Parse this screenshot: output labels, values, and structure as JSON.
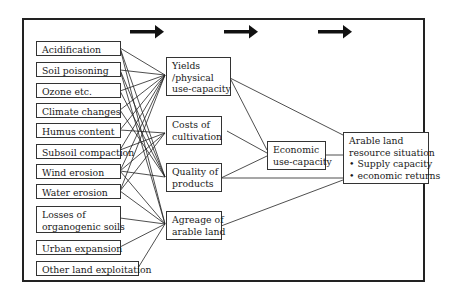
{
  "diagram": {
    "flow_arrows": [
      "arrow-1",
      "arrow-2",
      "arrow-3"
    ],
    "factors": [
      {
        "id": "acidification",
        "label": "Acidification"
      },
      {
        "id": "soil-poisoning",
        "label": "Soil poisoning"
      },
      {
        "id": "ozone",
        "label": "Ozone etc."
      },
      {
        "id": "climate-changes",
        "label": "Climate changes"
      },
      {
        "id": "humus-content",
        "label": "Humus content"
      },
      {
        "id": "subsoil-compaction",
        "label": "Subsoil compaction"
      },
      {
        "id": "wind-erosion",
        "label": "Wind erosion"
      },
      {
        "id": "water-erosion",
        "label": "Water erosion"
      },
      {
        "id": "losses-organogenic",
        "label_line1": "Losses of",
        "label_line2": "organogenic soils"
      },
      {
        "id": "urban-expansion",
        "label": "Urban expansion"
      },
      {
        "id": "other-land",
        "label": "Other land exploitation"
      }
    ],
    "intermediates": [
      {
        "id": "yields",
        "line1": "Yields",
        "line2": "/physical",
        "line3": "use-capacity"
      },
      {
        "id": "costs",
        "line1": "Costs of",
        "line2": "cultivation"
      },
      {
        "id": "quality",
        "line1": "Quality of",
        "line2": "products"
      },
      {
        "id": "agreage",
        "line1": "Agreage of",
        "line2": "arable land"
      }
    ],
    "economic": {
      "line1": "Economic",
      "line2": "use-capacity"
    },
    "outcome": {
      "line1": "Arable land",
      "line2": "resource situation",
      "bullets": [
        "• Supply capacity",
        "• economic returns"
      ]
    }
  }
}
